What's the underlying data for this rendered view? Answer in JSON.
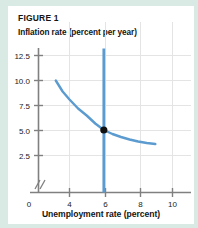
{
  "figure": {
    "label": "FIGURE 1",
    "y_axis_title": "Inflation rate (percent per year)",
    "x_axis_title": "Unemployment rate (percent)"
  },
  "colors": {
    "curve": "#5b9bd0",
    "vertical_line": "#5b9bd0",
    "point": "#111111",
    "axis": "#808080",
    "grid": "#e2e2e2",
    "panel_background": "#ffffff",
    "page_background": "#d9e9e4",
    "text": "#141414"
  },
  "chart_data": {
    "type": "line",
    "title": "FIGURE 1",
    "xlabel": "Unemployment rate (percent)",
    "ylabel": "Inflation rate (percent per year)",
    "xlim": [
      2.6,
      11.2
    ],
    "ylim": [
      0,
      13.6
    ],
    "grid": true,
    "legend": null,
    "x_ticks": [
      4,
      6,
      8,
      10
    ],
    "x_tick_labels": [
      "4",
      "6",
      "8",
      "10"
    ],
    "y_ticks": [
      2.5,
      5.0,
      7.5,
      10.0,
      12.5
    ],
    "y_tick_labels": [
      "2.5",
      "5.0",
      "7.5",
      "10.0",
      "12.5"
    ],
    "origin_label": "0",
    "axis_break": true,
    "series": [
      {
        "name": "short-run Phillips curve",
        "type": "line",
        "color": "#5b9bd0",
        "x": [
          3.2,
          3.6,
          4.0,
          4.5,
          5.0,
          5.5,
          6.0,
          6.5,
          7.0,
          7.5,
          8.0,
          8.5,
          9.0
        ],
        "y": [
          10.0,
          8.9,
          8.1,
          7.2,
          6.5,
          5.7,
          5.05,
          4.65,
          4.35,
          4.1,
          3.9,
          3.75,
          3.65
        ]
      },
      {
        "name": "long-run vertical line (natural rate)",
        "type": "vline",
        "color": "#5b9bd0",
        "x": [
          6.0,
          6.0
        ],
        "y": [
          0.0,
          13.2
        ]
      }
    ],
    "annotations": [
      {
        "name": "equilibrium-point",
        "marker": "filled-circle",
        "color": "#111111",
        "x": 6.0,
        "y": 5.05,
        "label": ""
      }
    ]
  }
}
